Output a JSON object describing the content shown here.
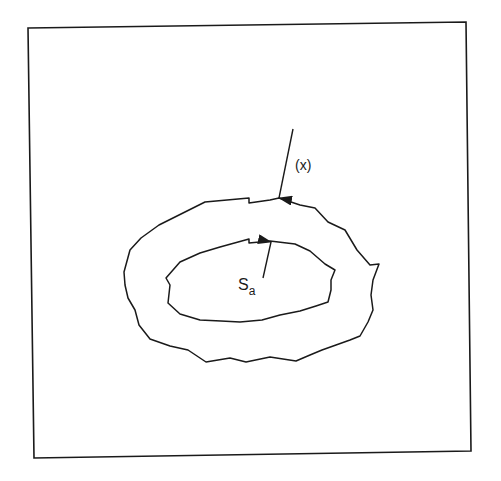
{
  "diagram": {
    "labels": {
      "x_label": "(x)",
      "s_main": "S",
      "s_sub": "a"
    },
    "colors": {
      "stroke": "#1a1a1a",
      "background": "#ffffff"
    }
  }
}
